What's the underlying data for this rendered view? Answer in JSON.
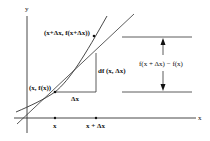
{
  "diagram": {
    "axes": {
      "x_label": "x",
      "y_label": "y"
    },
    "points": {
      "p1_label": "(x, f(x))",
      "p2_label": "(x+Δx, f(x+Δx))"
    },
    "ticks": {
      "x": "x",
      "x_plus_dx": "x + Δx"
    },
    "increments": {
      "dx_label": "Δx",
      "df_label": "df (x, Δx)",
      "difference_label": "f(x + Δx) − f(x)"
    },
    "colors": {
      "line": "#333333",
      "background": "#ffffff"
    }
  }
}
